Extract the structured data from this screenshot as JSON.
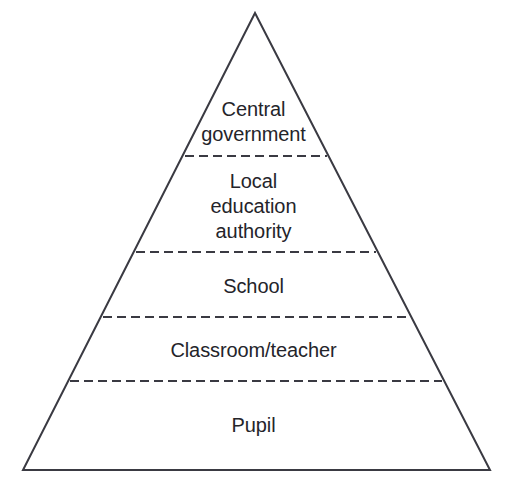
{
  "diagram": {
    "type": "pyramid-hierarchy",
    "shape": "triangle",
    "title": "",
    "style": {
      "outline_color": "#3a3a42",
      "outline_width": 2,
      "divider_color": "#3a3a42",
      "divider_width": 2,
      "divider_dash": "9,5",
      "background_color": "#ffffff",
      "text_color": "#24242a"
    },
    "geometry": {
      "apex": [
        255,
        13
      ],
      "bottom_left": [
        23,
        470
      ],
      "bottom_right": [
        490,
        470
      ]
    },
    "tiers": [
      {
        "id": "central-government",
        "rank": 1,
        "label": "Central\ngovernment",
        "lines": [
          "Central",
          "government"
        ],
        "divider_y": 156,
        "divider_x_start": 185,
        "divider_x_end": 327
      },
      {
        "id": "local-education-authority",
        "rank": 2,
        "label": "Local\neducation\nauthority",
        "lines": [
          "Local",
          "education",
          "authority"
        ],
        "divider_y": 252,
        "divider_x_start": 136,
        "divider_x_end": 376
      },
      {
        "id": "school",
        "rank": 3,
        "label": "School",
        "lines": [
          "School"
        ],
        "divider_y": 317,
        "divider_x_start": 103,
        "divider_x_end": 409
      },
      {
        "id": "classroom-teacher",
        "rank": 4,
        "label": "Classroom/teacher",
        "lines": [
          "Classroom/teacher"
        ],
        "divider_y": 381,
        "divider_x_start": 70,
        "divider_x_end": 442
      },
      {
        "id": "pupil",
        "rank": 5,
        "label": "Pupil",
        "lines": [
          "Pupil"
        ],
        "divider_y": null,
        "divider_x_start": null,
        "divider_x_end": null
      }
    ]
  }
}
